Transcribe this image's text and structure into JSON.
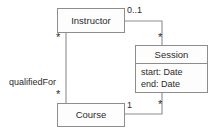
{
  "diagram": {
    "type": "uml-class-diagram",
    "canvas": {
      "width": 217,
      "height": 135,
      "background": "#ffffff"
    },
    "style": {
      "border_color": "#8d8d8d",
      "line_color": "#8d8d8d",
      "text_color": "#2b2b2b",
      "fill_color": "#fdfdfd"
    },
    "classes": [
      {
        "id": "instructor",
        "name": "Instructor",
        "x": 57,
        "y": 8,
        "width": 68,
        "height": 25,
        "attributes": []
      },
      {
        "id": "session",
        "name": "Session",
        "x": 135,
        "y": 45,
        "width": 73,
        "height": 48,
        "attributes": [
          "start: Date",
          "end: Date"
        ]
      },
      {
        "id": "course",
        "name": "Course",
        "x": 57,
        "y": 103,
        "width": 68,
        "height": 24,
        "attributes": []
      }
    ],
    "associations": [
      {
        "id": "instructor-session",
        "from": "instructor",
        "to": "session",
        "name": "",
        "source_multiplicity": "0..1",
        "target_multiplicity": "*"
      },
      {
        "id": "instructor-course",
        "from": "instructor",
        "to": "course",
        "name": "qualifiedFor",
        "source_multiplicity": "*",
        "target_multiplicity": "*"
      },
      {
        "id": "course-session",
        "from": "course",
        "to": "session",
        "name": "",
        "source_multiplicity": "1",
        "target_multiplicity": "*"
      }
    ],
    "labels": {
      "qualified_for": "qualifiedFor",
      "mult_zero_or_one": "0..1",
      "mult_one": "1",
      "mult_many_instructor_course": "*",
      "mult_many_course_instructor": "*",
      "mult_many_session_top": "*",
      "mult_many_session_bottom": "*"
    }
  }
}
